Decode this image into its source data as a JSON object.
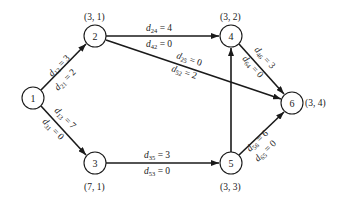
{
  "diagram": {
    "type": "network-graph",
    "colors": {
      "stroke": "#1a1a1a",
      "background": "#ffffff"
    },
    "nodes": [
      {
        "id": "1",
        "label": "1",
        "coord": "",
        "x": 33,
        "y": 98
      },
      {
        "id": "2",
        "label": "2",
        "coord": "(3, 1)",
        "x": 95,
        "y": 36
      },
      {
        "id": "3",
        "label": "3",
        "coord": "(7, 1)",
        "x": 95,
        "y": 163
      },
      {
        "id": "4",
        "label": "4",
        "coord": "(3, 2)",
        "x": 231,
        "y": 36
      },
      {
        "id": "5",
        "label": "5",
        "coord": "(3, 3)",
        "x": 231,
        "y": 163
      },
      {
        "id": "6",
        "label": "6",
        "coord": "(3, 4)",
        "x": 292,
        "y": 103
      }
    ],
    "edges": [
      {
        "from": "1",
        "to": "2",
        "top": {
          "sym": "d",
          "sub": "12",
          "val": " = 3"
        },
        "bottom": {
          "sym": "d",
          "sub": "21",
          "val": " = 2"
        }
      },
      {
        "from": "1",
        "to": "3",
        "top": {
          "sym": "d",
          "sub": "13",
          "val": " = 7"
        },
        "bottom": {
          "sym": "d",
          "sub": "31",
          "val": " = 0"
        }
      },
      {
        "from": "2",
        "to": "4",
        "top": {
          "sym": "d",
          "sub": "24",
          "val": " = 4"
        },
        "bottom": {
          "sym": "d",
          "sub": "42",
          "val": " = 0"
        }
      },
      {
        "from": "2",
        "to": "6",
        "top": {
          "sym": "d",
          "sub": "25",
          "val": " = 0"
        },
        "bottom": {
          "sym": "d",
          "sub": "52",
          "val": " = 2"
        }
      },
      {
        "from": "3",
        "to": "5",
        "top": {
          "sym": "d",
          "sub": "35",
          "val": " = 3"
        },
        "bottom": {
          "sym": "d",
          "sub": "53",
          "val": " = 0"
        }
      },
      {
        "from": "5",
        "to": "4",
        "top": null,
        "bottom": null
      },
      {
        "from": "4",
        "to": "6",
        "top": {
          "sym": "d",
          "sub": "46",
          "val": " = 3"
        },
        "bottom": {
          "sym": "d",
          "sub": "64",
          "val": " = 0"
        }
      },
      {
        "from": "5",
        "to": "6",
        "top": {
          "sym": "d",
          "sub": "56",
          "val": " = 6"
        },
        "bottom": {
          "sym": "d",
          "sub": "65",
          "val": " = 0"
        }
      }
    ]
  }
}
